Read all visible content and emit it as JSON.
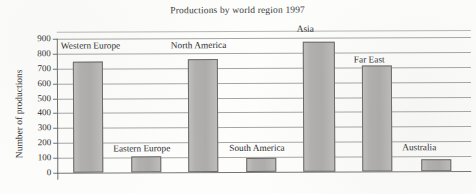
{
  "chart_data": {
    "type": "bar",
    "title": "Productions by world region 1997",
    "xlabel": "",
    "ylabel": "Number of productions",
    "categories": [
      "Western Europe",
      "Eastern Europe",
      "North America",
      "South America",
      "Asia",
      "Far East",
      "Australia"
    ],
    "values": [
      745,
      108,
      758,
      95,
      872,
      710,
      80
    ],
    "ylim": [
      0,
      900
    ],
    "ytick_labels": [
      "900",
      "800",
      "700",
      "600",
      "500",
      "400",
      "300",
      "200",
      "100",
      "0"
    ],
    "ytick_values": [
      900,
      800,
      700,
      600,
      500,
      400,
      300,
      200,
      100,
      0
    ],
    "grid": true,
    "legend": "none",
    "bar_color": "#b3b2b0",
    "bar_edge_color": "#6a6a68",
    "gridline_color": "#8d8d8d",
    "axis_color": "#6f6f6f",
    "label_placement": "inside-plot-above-bar"
  },
  "figure": {
    "background": "#fdfdfc",
    "text_color": "#2c2c2c"
  }
}
